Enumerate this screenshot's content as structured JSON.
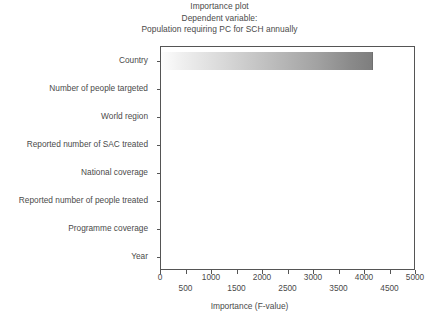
{
  "chart_data": {
    "type": "bar",
    "orientation": "horizontal",
    "title": "Importance plot",
    "subtitle": "Dependent variable:",
    "subtitle2": "Population requiring PC for SCH annually",
    "xlabel": "Importance (F-value)",
    "ylabel": "",
    "xlim": [
      0,
      5000
    ],
    "grid": false,
    "legend": null,
    "categories": [
      "Country",
      "Number of people targeted",
      "World region",
      "Reported number of SAC treated",
      "National coverage",
      "Reported number of people treated",
      "Programme coverage",
      "Year"
    ],
    "values": [
      4150,
      0,
      0,
      0,
      0,
      0,
      0,
      0
    ],
    "xticks": [
      0,
      500,
      1000,
      1500,
      2000,
      2500,
      3000,
      3500,
      4000,
      4500,
      5000
    ],
    "xtick_labels_row0": [
      "0",
      "1000",
      "2000",
      "3000",
      "4000",
      "5000"
    ],
    "xtick_labels_row1": [
      "500",
      "1500",
      "2500",
      "3500",
      "4500"
    ],
    "bar_gradient_start": "#fdfdfd",
    "bar_gradient_end": "#7e7e7e",
    "frame_color": "#555555",
    "text_color": "#4a4a4a",
    "background": "#ffffff"
  }
}
